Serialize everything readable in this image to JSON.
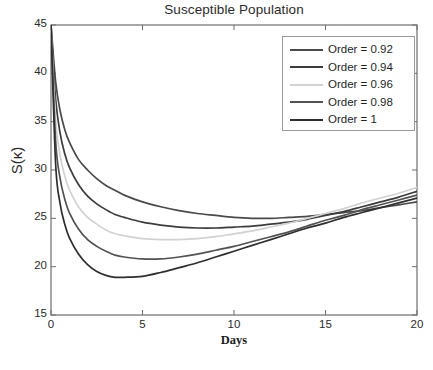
{
  "chart_data": {
    "type": "line",
    "title": "Susceptible Population",
    "xlabel": "Days",
    "ylabel": "S(κ)",
    "xlim": [
      0,
      20
    ],
    "ylim": [
      15,
      45
    ],
    "xticks": [
      0,
      5,
      10,
      15,
      20
    ],
    "yticks": [
      15,
      20,
      25,
      30,
      35,
      40,
      45
    ],
    "xtick_labels": [
      "0",
      "5",
      "10",
      "15",
      "20"
    ],
    "ytick_labels": [
      "15",
      "20",
      "25",
      "30",
      "35",
      "40",
      "45"
    ],
    "grid": false,
    "legend_position": "upper right",
    "x": [
      0,
      0.25,
      0.5,
      0.75,
      1,
      1.5,
      2,
      2.5,
      3,
      3.5,
      4,
      5,
      6,
      7,
      8,
      9,
      10,
      11,
      12,
      13,
      14,
      15,
      16,
      17,
      18,
      19,
      20
    ],
    "series": [
      {
        "name": "Order = 0.92",
        "color": "#4a4a4a",
        "values": [
          45.0,
          39.2,
          36.1,
          34.2,
          32.9,
          31.1,
          30.0,
          29.1,
          28.4,
          27.9,
          27.4,
          26.7,
          26.2,
          25.8,
          25.5,
          25.3,
          25.1,
          25.0,
          25.0,
          25.1,
          25.2,
          25.4,
          25.6,
          25.8,
          26.1,
          26.4,
          26.7
        ]
      },
      {
        "name": "Order = 0.94",
        "color": "#3c3c3c",
        "values": [
          45.0,
          37.4,
          33.8,
          31.7,
          30.3,
          28.5,
          27.3,
          26.5,
          25.9,
          25.4,
          25.1,
          24.6,
          24.3,
          24.1,
          24.0,
          24.0,
          24.1,
          24.2,
          24.4,
          24.6,
          24.9,
          25.3,
          25.7,
          26.2,
          26.7,
          27.2,
          27.8
        ]
      },
      {
        "name": "Order = 0.96",
        "color": "#d2d2d2",
        "values": [
          45.0,
          35.3,
          31.5,
          29.4,
          28.0,
          26.2,
          25.1,
          24.4,
          23.8,
          23.4,
          23.2,
          22.9,
          22.8,
          22.8,
          22.9,
          23.1,
          23.4,
          23.7,
          24.1,
          24.5,
          25.0,
          25.5,
          26.0,
          26.6,
          27.1,
          27.6,
          28.2
        ]
      },
      {
        "name": "Order = 0.98",
        "color": "#525252",
        "values": [
          45.0,
          33.1,
          29.1,
          27.0,
          25.6,
          23.9,
          22.8,
          22.1,
          21.6,
          21.2,
          21.0,
          20.8,
          20.8,
          21.0,
          21.3,
          21.7,
          22.1,
          22.6,
          23.1,
          23.6,
          24.2,
          24.8,
          25.3,
          25.9,
          26.4,
          26.9,
          27.4
        ]
      },
      {
        "name": "Order = 1",
        "color": "#2e2e2e",
        "values": [
          45.0,
          30.7,
          26.5,
          24.4,
          23.0,
          21.3,
          20.2,
          19.5,
          19.1,
          18.9,
          18.9,
          19.0,
          19.4,
          19.9,
          20.4,
          21.0,
          21.6,
          22.2,
          22.8,
          23.4,
          24.0,
          24.5,
          25.1,
          25.6,
          26.1,
          26.6,
          27.1
        ]
      }
    ]
  },
  "axes": {
    "frame_color": "#6e6e6e"
  }
}
